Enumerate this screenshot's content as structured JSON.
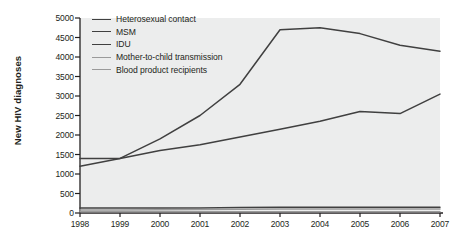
{
  "chart_data": {
    "type": "line",
    "title": "",
    "xlabel": "",
    "ylabel": "New HIV diagnoses",
    "x": [
      1998,
      1999,
      2000,
      2001,
      2002,
      2003,
      2004,
      2005,
      2006,
      2007
    ],
    "xtick_labels": [
      "1998",
      "1999",
      "2000",
      "2001",
      "2002",
      "2003",
      "2004",
      "2005",
      "2006",
      "2007"
    ],
    "ytick_labels": [
      "0",
      "500",
      "1000",
      "1500",
      "2000",
      "2500",
      "3000",
      "3500",
      "4000",
      "4500",
      "5000"
    ],
    "ytick_values": [
      0,
      500,
      1000,
      1500,
      2000,
      2500,
      3000,
      3500,
      4000,
      4500,
      5000
    ],
    "ylim": [
      0,
      5000
    ],
    "xlim": [
      1998,
      2007
    ],
    "grid": false,
    "legend_position": "top-left",
    "series": [
      {
        "name": "Heterosexual contact",
        "color": "#404040",
        "values": [
          1400,
          1400,
          1600,
          1750,
          1950,
          2150,
          2350,
          2600,
          2550,
          3050
        ]
      },
      {
        "name": "MSM",
        "color": "#404040",
        "values": [
          1200,
          1400,
          1900,
          2500,
          3300,
          4700,
          4750,
          4600,
          4300,
          4150
        ]
      },
      {
        "name": "IDU",
        "color": "#404040",
        "values": [
          130,
          130,
          130,
          130,
          140,
          150,
          150,
          150,
          150,
          150
        ]
      },
      {
        "name": "Mother-to-child transmission",
        "color": "#9a9a9a",
        "values": [
          80,
          80,
          85,
          90,
          95,
          100,
          100,
          100,
          100,
          100
        ]
      },
      {
        "name": "Blood product recipients",
        "color": "#9a9a9a",
        "values": [
          30,
          30,
          30,
          30,
          30,
          30,
          30,
          30,
          30,
          30
        ]
      }
    ]
  },
  "axes": {
    "axis_color": "#231f20",
    "plot_background": "#eceded"
  }
}
